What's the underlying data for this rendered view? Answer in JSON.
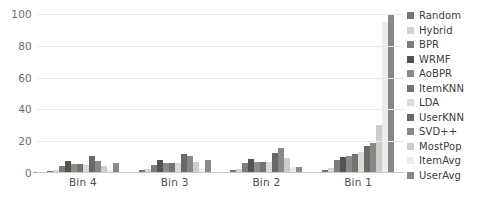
{
  "chart_data": {
    "type": "bar",
    "title": "",
    "subtitle": "",
    "xlabel": "",
    "ylabel": "",
    "categories": [
      "Bin 4",
      "Bin 3",
      "Bin 2",
      "Bin 1"
    ],
    "ylim": [
      0,
      100
    ],
    "yticks": [
      0,
      20,
      40,
      60,
      80,
      100
    ],
    "grid": true,
    "legend_position": "right",
    "series": [
      {
        "name": "Random",
        "color": "#767472",
        "values": [
          1.5,
          2.0,
          2.0,
          2.0
        ]
      },
      {
        "name": "Hybrid",
        "color": "#d6d4d2",
        "values": [
          2.0,
          2.5,
          2.5,
          3.0
        ]
      },
      {
        "name": "BPR",
        "color": "#7e7c7a",
        "values": [
          4.5,
          5.0,
          6.5,
          8.0
        ]
      },
      {
        "name": "WRMF",
        "color": "#55534f",
        "values": [
          7.5,
          8.5,
          9.0,
          10.0
        ]
      },
      {
        "name": "AoBPR",
        "color": "#8d8b89",
        "values": [
          5.5,
          6.5,
          7.0,
          11.0
        ]
      },
      {
        "name": "ItemKNN",
        "color": "#75736f",
        "values": [
          5.5,
          6.0,
          7.0,
          12.0
        ]
      },
      {
        "name": "LDA",
        "color": "#dcdad8",
        "values": [
          5.0,
          6.0,
          7.0,
          13.0
        ]
      },
      {
        "name": "UserKNN",
        "color": "#6b6966",
        "values": [
          11.0,
          12.0,
          12.5,
          17.0
        ]
      },
      {
        "name": "SVD++",
        "color": "#8a8886",
        "values": [
          7.5,
          10.5,
          15.5,
          19.0
        ]
      },
      {
        "name": "MostPop",
        "color": "#cfcdcb",
        "values": [
          4.5,
          7.0,
          9.5,
          30.0
        ]
      },
      {
        "name": "ItemAvg",
        "color": "#ececea",
        "values": [
          2.0,
          2.5,
          3.5,
          95.0
        ]
      },
      {
        "name": "UserAvg",
        "color": "#8b8987",
        "values": [
          6.5,
          8.5,
          4.0,
          100.0
        ]
      }
    ]
  },
  "axis": {
    "y_tick_labels": [
      "100",
      "80",
      "60",
      "40",
      "20",
      "0"
    ]
  },
  "colors": {
    "gridline": "#eceae8",
    "baseline": "#c9c6c3",
    "tick_text": "#6e6b68",
    "label_text": "#4f4c4a",
    "legend_text": "#3e3c3a",
    "background": "#ffffff"
  }
}
